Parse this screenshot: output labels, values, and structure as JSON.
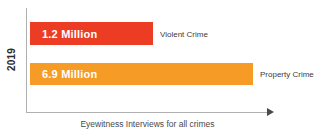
{
  "chart_data": {
    "type": "bar",
    "orientation": "horizontal",
    "title": "",
    "xlabel": "Eyewitness Interviews for all crimes",
    "ylabel": "2019",
    "categories": [
      "Violent Crime",
      "Property Crime"
    ],
    "values": [
      1.2,
      6.9
    ],
    "value_unit": "Million",
    "value_labels": [
      "1.2 Million",
      "6.9 Million"
    ],
    "series": [
      {
        "name": "Violent Crime",
        "value": 1.2,
        "value_label": "1.2 Million",
        "color": "#EC3D24"
      },
      {
        "name": "Property Crime",
        "value": 6.9,
        "value_label": "6.9 Million",
        "color": "#F59B26"
      }
    ],
    "xlim": [
      0,
      7.6
    ],
    "grid": false,
    "legend": "inline-right-of-bar",
    "axis_arrow": true
  },
  "colors": {
    "violent_crime": "#EC3D24",
    "property_crime": "#F59B26",
    "axis_line": "#b0b0b0",
    "axis_text": "#4a4a4a",
    "value_text": "#ffffff",
    "background": "#ffffff"
  }
}
